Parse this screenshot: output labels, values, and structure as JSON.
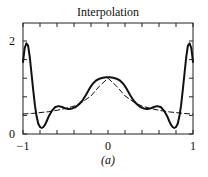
{
  "chart_data": {
    "type": "line",
    "title": "Interpolation",
    "caption": "(a)",
    "xlabel": "",
    "ylabel": "",
    "xlim": [
      -1,
      1
    ],
    "ylim": [
      0,
      2.2
    ],
    "xticks": [
      -1,
      -0.8,
      -0.6,
      -0.4,
      -0.2,
      0,
      0.2,
      0.4,
      0.6,
      0.8,
      1
    ],
    "xtick_labels": [
      {
        "value": -1,
        "label": "−1"
      },
      {
        "value": 0,
        "label": "0"
      },
      {
        "value": 1,
        "label": "1"
      }
    ],
    "yticks": [
      0,
      0.4,
      0.8,
      1.2,
      1.6,
      2
    ],
    "ytick_labels": [
      {
        "value": 0,
        "label": "0"
      },
      {
        "value": 2,
        "label": "2"
      }
    ],
    "grid": false,
    "legend": null,
    "series": [
      {
        "name": "interpolant",
        "style": "solid",
        "x": [
          -1,
          -0.98,
          -0.96,
          -0.94,
          -0.92,
          -0.9,
          -0.88,
          -0.86,
          -0.84,
          -0.82,
          -0.8,
          -0.78,
          -0.76,
          -0.74,
          -0.72,
          -0.7,
          -0.66,
          -0.62,
          -0.58,
          -0.54,
          -0.5,
          -0.46,
          -0.42,
          -0.38,
          -0.34,
          -0.3,
          -0.26,
          -0.22,
          -0.18,
          -0.14,
          -0.1,
          -0.06,
          -0.02,
          0,
          0.02,
          0.06,
          0.1,
          0.14,
          0.18,
          0.22,
          0.26,
          0.3,
          0.34,
          0.38,
          0.42,
          0.46,
          0.5,
          0.54,
          0.58,
          0.62,
          0.66,
          0.7,
          0.72,
          0.74,
          0.76,
          0.78,
          0.8,
          0.82,
          0.84,
          0.86,
          0.88,
          0.9,
          0.92,
          0.94,
          0.96,
          0.98,
          1
        ],
        "y": [
          1.55,
          1.85,
          1.95,
          1.9,
          1.65,
          1.3,
          0.95,
          0.62,
          0.38,
          0.22,
          0.15,
          0.13,
          0.15,
          0.2,
          0.28,
          0.37,
          0.5,
          0.58,
          0.6,
          0.58,
          0.55,
          0.54,
          0.55,
          0.58,
          0.64,
          0.72,
          0.84,
          0.97,
          1.08,
          1.15,
          1.19,
          1.21,
          1.22,
          1.22,
          1.22,
          1.21,
          1.19,
          1.15,
          1.08,
          0.97,
          0.84,
          0.72,
          0.64,
          0.58,
          0.55,
          0.54,
          0.55,
          0.58,
          0.6,
          0.58,
          0.5,
          0.37,
          0.28,
          0.2,
          0.15,
          0.13,
          0.15,
          0.22,
          0.38,
          0.62,
          0.95,
          1.3,
          1.65,
          1.9,
          1.95,
          1.85,
          1.55
        ]
      },
      {
        "name": "exact function",
        "style": "dashed",
        "x": [
          -1,
          -0.9,
          -0.8,
          -0.7,
          -0.6,
          -0.5,
          -0.4,
          -0.3,
          -0.2,
          -0.1,
          0,
          0.1,
          0.2,
          0.3,
          0.4,
          0.5,
          0.6,
          0.7,
          0.8,
          0.9,
          1
        ],
        "y": [
          0.43,
          0.44,
          0.46,
          0.48,
          0.51,
          0.55,
          0.6,
          0.69,
          0.82,
          1.03,
          1.2,
          1.03,
          0.82,
          0.69,
          0.6,
          0.55,
          0.51,
          0.48,
          0.46,
          0.44,
          0.43
        ]
      }
    ]
  }
}
